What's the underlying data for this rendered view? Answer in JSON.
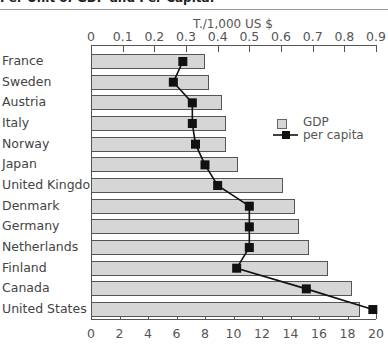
{
  "header": {
    "title": "Per Unit of GDP and Per Capita."
  },
  "chart_data": {
    "type": "bar",
    "title": "Per Unit of GDP and Per Capita.",
    "categories": [
      "France",
      "Sweden",
      "Austria",
      "Italy",
      "Norway",
      "Japan",
      "United Kingdom",
      "Denmark",
      "Germany",
      "Netherlands",
      "Finland",
      "Canada",
      "United States"
    ],
    "series": [
      {
        "name": "GDP",
        "type": "bar",
        "axis": "bottom",
        "values": [
          8.0,
          8.3,
          9.2,
          9.5,
          9.5,
          10.3,
          13.5,
          14.3,
          14.6,
          15.3,
          16.6,
          18.3,
          18.9
        ]
      },
      {
        "name": "per capita",
        "type": "line",
        "axis": "top",
        "values": [
          0.29,
          0.26,
          0.32,
          0.32,
          0.33,
          0.36,
          0.4,
          0.5,
          0.5,
          0.5,
          0.46,
          0.68,
          0.89
        ]
      }
    ],
    "top_axis": {
      "label": "T./1,000 US $",
      "ticks": [
        "0",
        "0.1",
        "0.2",
        "0.3",
        "0.4",
        "0.5",
        "0.6",
        "0.7",
        "0.8",
        "0.9"
      ],
      "range": [
        0,
        0.9
      ]
    },
    "bottom_axis": {
      "label": "",
      "ticks": [
        "0",
        "2",
        "4",
        "6",
        "8",
        "10",
        "12",
        "14",
        "16",
        "18",
        "20"
      ],
      "range": [
        0,
        20
      ]
    },
    "legend": {
      "position": "right-upper",
      "entries": [
        "GDP",
        "per capita"
      ]
    },
    "grid": false,
    "orientation": "horizontal"
  }
}
